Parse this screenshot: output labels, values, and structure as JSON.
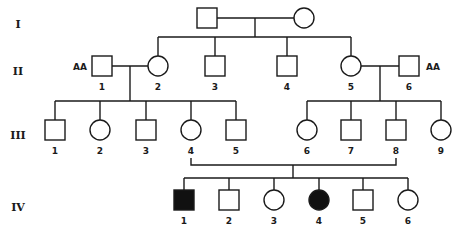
{
  "colors": {
    "line": "#1a1a1a",
    "affected": "#111111",
    "unaffected": "#ffffff"
  },
  "generations": [
    {
      "id": "I",
      "label": "I",
      "y": 24
    },
    {
      "id": "II",
      "label": "II",
      "y": 71
    },
    {
      "id": "III",
      "label": "III",
      "y": 135
    },
    {
      "id": "IV",
      "label": "IV",
      "y": 207
    }
  ],
  "individuals": {
    "I": [
      {
        "num": "",
        "sex": "male",
        "affected": false,
        "x": 207,
        "y": 18
      },
      {
        "num": "",
        "sex": "female",
        "affected": false,
        "x": 304,
        "y": 18
      }
    ],
    "II": [
      {
        "num": "1",
        "sex": "male",
        "affected": false,
        "x": 102,
        "y": 66,
        "genotype": "AA"
      },
      {
        "num": "2",
        "sex": "female",
        "affected": false,
        "x": 158,
        "y": 66
      },
      {
        "num": "3",
        "sex": "male",
        "affected": false,
        "x": 215,
        "y": 66
      },
      {
        "num": "4",
        "sex": "male",
        "affected": false,
        "x": 287,
        "y": 66
      },
      {
        "num": "5",
        "sex": "female",
        "affected": false,
        "x": 351,
        "y": 66
      },
      {
        "num": "6",
        "sex": "male",
        "affected": false,
        "x": 409,
        "y": 66,
        "genotype": "AA"
      }
    ],
    "III": [
      {
        "num": "1",
        "sex": "male",
        "affected": false,
        "x": 55,
        "y": 130
      },
      {
        "num": "2",
        "sex": "female",
        "affected": false,
        "x": 100,
        "y": 130
      },
      {
        "num": "3",
        "sex": "male",
        "affected": false,
        "x": 146,
        "y": 130
      },
      {
        "num": "4",
        "sex": "female",
        "affected": false,
        "x": 191,
        "y": 130
      },
      {
        "num": "5",
        "sex": "male",
        "affected": false,
        "x": 236,
        "y": 130
      },
      {
        "num": "6",
        "sex": "female",
        "affected": false,
        "x": 307,
        "y": 130
      },
      {
        "num": "7",
        "sex": "male",
        "affected": false,
        "x": 351,
        "y": 130
      },
      {
        "num": "8",
        "sex": "male",
        "affected": false,
        "x": 396,
        "y": 130
      },
      {
        "num": "9",
        "sex": "female",
        "affected": false,
        "x": 441,
        "y": 130
      }
    ],
    "IV": [
      {
        "num": "1",
        "sex": "male",
        "affected": true,
        "x": 184,
        "y": 200
      },
      {
        "num": "2",
        "sex": "male",
        "affected": false,
        "x": 229,
        "y": 200
      },
      {
        "num": "3",
        "sex": "female",
        "affected": false,
        "x": 274,
        "y": 200
      },
      {
        "num": "4",
        "sex": "female",
        "affected": true,
        "x": 319,
        "y": 200
      },
      {
        "num": "5",
        "sex": "male",
        "affected": false,
        "x": 363,
        "y": 200
      },
      {
        "num": "6",
        "sex": "female",
        "affected": false,
        "x": 408,
        "y": 200
      }
    ]
  },
  "genotype_labels": {
    "II-1": "AA",
    "II-6": "AA"
  }
}
